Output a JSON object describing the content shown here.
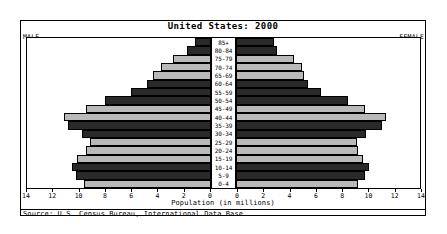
{
  "chart_data": {
    "type": "bar",
    "subtype": "population-pyramid",
    "title": "United States: 2000",
    "xlabel": "Population (in millions)",
    "ylabel": "",
    "xlim": [
      0,
      14
    ],
    "grid": false,
    "legend_position": "none",
    "left_label": "MALE",
    "right_label": "FEMALE",
    "source": "Source: U.S. Census Bureau, International Data Base.",
    "categories": [
      "85+",
      "80-84",
      "75-79",
      "70-74",
      "65-69",
      "60-64",
      "55-59",
      "50-54",
      "45-49",
      "40-44",
      "35-39",
      "30-34",
      "25-29",
      "20-24",
      "15-19",
      "10-14",
      "5-9",
      "0-4"
    ],
    "axis_ticks_left": [
      "14",
      "12",
      "10",
      "8",
      "6",
      "4",
      "2",
      "0"
    ],
    "axis_ticks_right": [
      "0",
      "2",
      "4",
      "6",
      "8",
      "10",
      "12",
      "14"
    ],
    "series": [
      {
        "name": "MALE",
        "side": "left",
        "values": [
          1.2,
          1.8,
          2.9,
          3.8,
          4.4,
          4.9,
          6.1,
          8.1,
          9.5,
          11.2,
          10.9,
          9.8,
          9.2,
          9.5,
          10.2,
          10.6,
          10.3,
          9.7
        ]
      },
      {
        "name": "FEMALE",
        "side": "right",
        "values": [
          2.9,
          3.1,
          4.4,
          5.0,
          5.2,
          5.5,
          6.5,
          8.5,
          9.8,
          11.4,
          11.1,
          9.9,
          9.2,
          9.3,
          9.7,
          10.1,
          9.8,
          9.3
        ]
      }
    ],
    "bar_shades": [
      "dark",
      "dark",
      "light",
      "light",
      "light",
      "dark",
      "dark",
      "dark",
      "light",
      "light",
      "dark",
      "dark",
      "light",
      "light",
      "light",
      "dark",
      "dark",
      "light"
    ],
    "colors": {
      "bar_dark": "#2a2a2a",
      "bar_light": "#b9b9b9",
      "frame": "#000000",
      "background": "#ffffff"
    }
  }
}
